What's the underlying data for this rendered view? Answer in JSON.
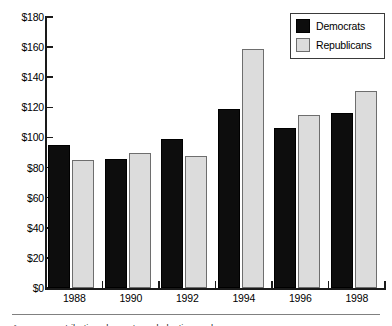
{
  "chart_data": {
    "type": "bar",
    "title": "",
    "subtitle": "",
    "xlabel": "",
    "ylabel": "",
    "categories": [
      "1988",
      "1990",
      "1992",
      "1994",
      "1996",
      "1998"
    ],
    "series": [
      {
        "name": "Democrats",
        "color": "#0d0d0d",
        "values": [
          95,
          86,
          99,
          119,
          106,
          116
        ]
      },
      {
        "name": "Republicans",
        "color": "#dcdcdc",
        "values": [
          85,
          90,
          88,
          159,
          115,
          131
        ]
      }
    ],
    "ylim": [
      0,
      180
    ],
    "ytick_step": 20,
    "ytick_labels": [
      "$0",
      "$20",
      "$40",
      "$60",
      "$80",
      "$100",
      "$120",
      "$140",
      "$160",
      "$180"
    ],
    "grid": false,
    "legend_position": "top-right"
  },
  "legend": {
    "items": [
      {
        "label": "Democrats"
      },
      {
        "label": "Republicans"
      }
    ]
  },
  "footer": {
    "caption": "Average contributions by party and election cycle"
  }
}
